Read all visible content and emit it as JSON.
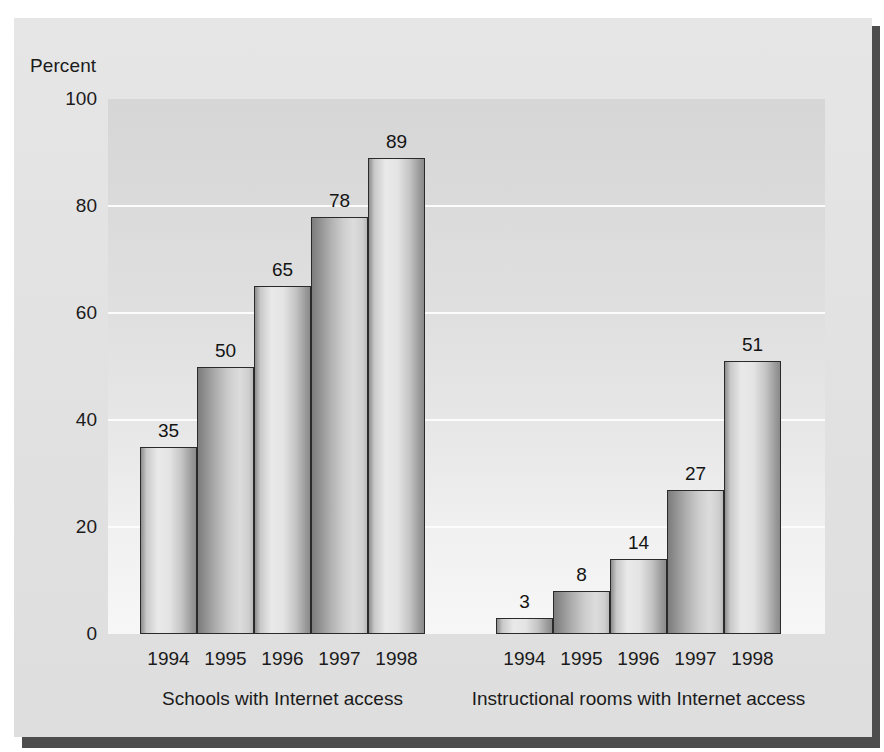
{
  "chart_data": {
    "type": "bar",
    "title": "",
    "subtitle": "",
    "xlabel": "",
    "ylabel": "Percent",
    "ylim": [
      0,
      100
    ],
    "yticks": [
      0,
      20,
      40,
      60,
      80,
      100
    ],
    "ytick_labels": [
      "0",
      "20",
      "40",
      "60",
      "80",
      "100"
    ],
    "grid": "horizontal-white-gridlines-at-20-40-60-80",
    "legend": "none",
    "categories": [
      "1994",
      "1995",
      "1996",
      "1997",
      "1998"
    ],
    "groups": [
      {
        "name": "Schools with Internet access",
        "caption": "Schools with Internet access",
        "categories": [
          "1994",
          "1995",
          "1996",
          "1997",
          "1998"
        ],
        "values": [
          35,
          50,
          65,
          78,
          89
        ],
        "value_labels": [
          "35",
          "50",
          "65",
          "78",
          "89"
        ]
      },
      {
        "name": "Instructional rooms with Internet access",
        "caption": "Instructional rooms with Internet access",
        "categories": [
          "1994",
          "1995",
          "1996",
          "1997",
          "1998"
        ],
        "values": [
          3,
          8,
          14,
          27,
          51
        ],
        "value_labels": [
          "3",
          "8",
          "14",
          "27",
          "51"
        ]
      }
    ],
    "colors": {
      "card_background": "#e3e3e3",
      "panel_background": "#dedede",
      "gridline": "#fcfcfc",
      "bar_outline": "#2a2a2a",
      "bar_fill_light": "#e9e9e9",
      "bar_fill_dark": "#8a8a8a",
      "text": "#1b1b1b",
      "shadow": "#4d4d4d"
    }
  }
}
